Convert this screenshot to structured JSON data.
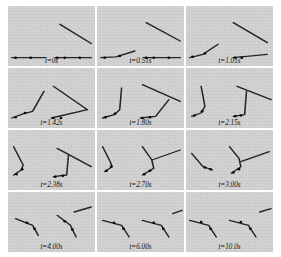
{
  "figure": {
    "type": "image-sequence-grid",
    "rows": 4,
    "cols": 3,
    "panel_background": "#d2d2d2",
    "stroke_color": "#1a1a1a",
    "node_color": "#000000"
  },
  "chart_data": {
    "type": "scatter",
    "title": "",
    "xlabel": "",
    "ylabel": "",
    "categories": [
      "t=0s",
      "t=0.51s",
      "t=1.01s",
      "t=1.42s",
      "t=1.80s",
      "t=2.15s",
      "t=2.38s",
      "t=2.70s",
      "t=3.00s",
      "t=4.00s",
      "t=6.00s",
      "t=10.0s"
    ],
    "values": [
      0,
      0.51,
      1.01,
      1.42,
      1.8,
      2.15,
      2.38,
      2.7,
      3.0,
      4.0,
      6.0,
      10.0
    ]
  },
  "panels": [
    {
      "id": "panel-1",
      "label": "t=0s",
      "time_value": "0",
      "left_chain": [
        [
          4,
          62
        ],
        [
          40,
          62
        ]
      ],
      "left_nodes": [
        [
          8,
          62
        ],
        [
          24,
          62
        ]
      ],
      "right_chain": [
        [
          50,
          62
        ],
        [
          88,
          62
        ]
      ],
      "right_nodes": [
        [
          52,
          62
        ],
        [
          60,
          62
        ],
        [
          76,
          62
        ]
      ],
      "free_bar": [
        [
          55,
          22
        ],
        [
          88,
          45
        ]
      ]
    },
    {
      "id": "panel-2",
      "label": "t=0.51s",
      "time_value": "0.51",
      "left_chain": [
        [
          4,
          62
        ],
        [
          20,
          61
        ],
        [
          40,
          54
        ]
      ],
      "left_nodes": [
        [
          8,
          62
        ],
        [
          24,
          60
        ]
      ],
      "right_chain": [
        [
          50,
          62
        ],
        [
          88,
          62
        ]
      ],
      "right_nodes": [
        [
          52,
          62
        ],
        [
          60,
          62
        ],
        [
          76,
          62
        ]
      ],
      "free_bar": [
        [
          52,
          20
        ],
        [
          88,
          42
        ]
      ]
    },
    {
      "id": "panel-3",
      "label": "t=1.01s",
      "time_value": "1.01",
      "left_chain": [
        [
          4,
          62
        ],
        [
          18,
          58
        ],
        [
          34,
          46
        ]
      ],
      "left_nodes": [
        [
          7,
          61
        ],
        [
          20,
          57
        ]
      ],
      "right_chain": [
        [
          50,
          62
        ],
        [
          86,
          58
        ]
      ],
      "right_nodes": [
        [
          52,
          62
        ],
        [
          59,
          62
        ]
      ],
      "free_bar": [
        [
          50,
          20
        ],
        [
          86,
          44
        ]
      ]
    },
    {
      "id": "panel-4",
      "label": "t=1.42s",
      "time_value": "1.42",
      "left_chain": [
        [
          4,
          60
        ],
        [
          16,
          55
        ],
        [
          26,
          52
        ],
        [
          38,
          28
        ]
      ],
      "left_nodes": [
        [
          8,
          59
        ],
        [
          18,
          54
        ]
      ],
      "right_chain": [
        [
          46,
          60
        ],
        [
          84,
          50
        ]
      ],
      "right_nodes": [
        [
          48,
          60
        ],
        [
          56,
          60
        ]
      ],
      "free_bar": [
        [
          48,
          22
        ],
        [
          84,
          50
        ]
      ]
    },
    {
      "id": "panel-5",
      "label": "t=1.80s",
      "time_value": "1.80",
      "left_chain": [
        [
          6,
          60
        ],
        [
          18,
          56
        ],
        [
          24,
          50
        ],
        [
          26,
          24
        ]
      ],
      "left_nodes": [
        [
          9,
          59
        ],
        [
          19,
          55
        ]
      ],
      "right_chain": [
        [
          46,
          60
        ],
        [
          62,
          58
        ],
        [
          76,
          38
        ]
      ],
      "right_nodes": [
        [
          48,
          60
        ],
        [
          56,
          59
        ]
      ],
      "free_bar": [
        [
          48,
          20
        ],
        [
          88,
          40
        ]
      ]
    },
    {
      "id": "panel-6",
      "label": "t=2.15s",
      "time_value": "2.15",
      "left_chain": [
        [
          6,
          58
        ],
        [
          16,
          54
        ],
        [
          20,
          46
        ],
        [
          16,
          22
        ]
      ],
      "left_nodes": [
        [
          9,
          57
        ],
        [
          17,
          52
        ]
      ],
      "right_chain": [
        [
          50,
          58
        ],
        [
          62,
          56
        ],
        [
          64,
          28
        ]
      ],
      "right_nodes": [
        [
          52,
          58
        ],
        [
          58,
          57
        ]
      ],
      "free_bar": [
        [
          54,
          22
        ],
        [
          90,
          38
        ]
      ]
    },
    {
      "id": "panel-7",
      "label": "t=2.38s",
      "time_value": "2.38",
      "left_chain": [
        [
          6,
          54
        ],
        [
          14,
          48
        ],
        [
          16,
          42
        ],
        [
          6,
          20
        ]
      ],
      "left_nodes": [
        [
          9,
          53
        ],
        [
          15,
          47
        ]
      ],
      "right_chain": [
        [
          48,
          56
        ],
        [
          62,
          54
        ],
        [
          64,
          30
        ]
      ],
      "right_nodes": [
        [
          50,
          56
        ],
        [
          58,
          55
        ]
      ],
      "free_bar": [
        [
          52,
          22
        ],
        [
          88,
          44
        ]
      ]
    },
    {
      "id": "panel-8",
      "label": "t=2.70s",
      "time_value": "2.70",
      "left_chain": [
        [
          8,
          50
        ],
        [
          16,
          44
        ],
        [
          14,
          38
        ],
        [
          6,
          20
        ]
      ],
      "left_nodes": [
        [
          10,
          49
        ],
        [
          15,
          44
        ]
      ],
      "right_chain": [
        [
          48,
          54
        ],
        [
          60,
          46
        ],
        [
          58,
          36
        ],
        [
          48,
          20
        ]
      ],
      "right_nodes": [
        [
          50,
          53
        ],
        [
          56,
          49
        ]
      ],
      "free_bar": [
        [
          58,
          36
        ],
        [
          88,
          24
        ]
      ]
    },
    {
      "id": "panel-9",
      "label": "t=3.00s",
      "time_value": "3.00",
      "left_chain": [
        [
          6,
          28
        ],
        [
          18,
          44
        ],
        [
          28,
          48
        ]
      ],
      "left_nodes": [
        [
          20,
          45
        ],
        [
          26,
          47
        ]
      ],
      "right_chain": [
        [
          48,
          52
        ],
        [
          58,
          44
        ],
        [
          56,
          34
        ],
        [
          46,
          20
        ]
      ],
      "right_nodes": [
        [
          50,
          51
        ],
        [
          56,
          47
        ]
      ],
      "free_bar": [
        [
          58,
          38
        ],
        [
          88,
          26
        ]
      ]
    },
    {
      "id": "panel-10",
      "label": "t=4.00s",
      "time_value": "4.00",
      "left_chain": [
        [
          8,
          32
        ],
        [
          26,
          40
        ],
        [
          32,
          52
        ]
      ],
      "left_nodes": [
        [
          20,
          37
        ],
        [
          28,
          44
        ]
      ],
      "right_chain": [
        [
          52,
          28
        ],
        [
          66,
          40
        ],
        [
          72,
          54
        ]
      ],
      "right_nodes": [
        [
          60,
          35
        ],
        [
          68,
          45
        ]
      ],
      "free_bar": [
        [
          70,
          24
        ],
        [
          88,
          18
        ]
      ]
    },
    {
      "id": "panel-11",
      "label": "t=6.00s",
      "time_value": "6.00",
      "left_chain": [
        [
          6,
          34
        ],
        [
          26,
          40
        ],
        [
          34,
          54
        ]
      ],
      "left_nodes": [
        [
          18,
          37
        ],
        [
          28,
          44
        ]
      ],
      "right_chain": [
        [
          48,
          34
        ],
        [
          68,
          40
        ],
        [
          76,
          54
        ]
      ],
      "right_nodes": [
        [
          60,
          37
        ],
        [
          70,
          44
        ]
      ],
      "free_bar": [
        [
          80,
          26
        ],
        [
          90,
          22
        ]
      ]
    },
    {
      "id": "panel-12",
      "label": "t=10.0s",
      "time_value": "10.0",
      "left_chain": [
        [
          4,
          34
        ],
        [
          24,
          40
        ],
        [
          32,
          54
        ]
      ],
      "left_nodes": [
        [
          16,
          36
        ],
        [
          26,
          44
        ]
      ],
      "right_chain": [
        [
          46,
          34
        ],
        [
          66,
          40
        ],
        [
          74,
          54
        ]
      ],
      "right_nodes": [
        [
          58,
          36
        ],
        [
          68,
          44
        ]
      ],
      "free_bar": [
        [
          78,
          24
        ],
        [
          90,
          20
        ]
      ]
    }
  ]
}
